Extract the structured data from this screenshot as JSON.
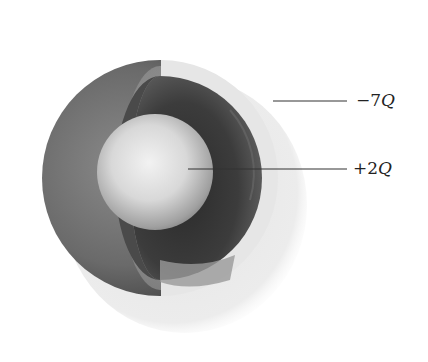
{
  "figure": {
    "labels": [
      {
        "id": "outer-shell",
        "sign": "−7",
        "symbol": "Q",
        "text": "−7Q"
      },
      {
        "id": "inner-sphere",
        "sign": "+2",
        "symbol": "Q",
        "text": "+2Q"
      }
    ]
  }
}
